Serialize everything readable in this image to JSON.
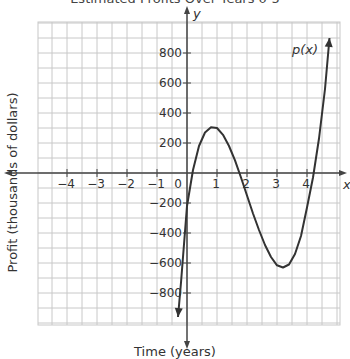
{
  "chart_data": {
    "type": "line",
    "title": "Estimated Profits Over Years 0-5",
    "xlabel": "Time (years)",
    "ylabel": "Profit (thousands of dollars)",
    "x_axis_symbol": "x",
    "y_axis_symbol": "y",
    "series": [
      {
        "name": "p(x)",
        "x": [
          -0.3,
          -0.2,
          0,
          0.2,
          0.4,
          0.6,
          0.8,
          1.0,
          1.2,
          1.4,
          1.6,
          1.8,
          2.0,
          2.2,
          2.4,
          2.6,
          2.8,
          3.0,
          3.2,
          3.4,
          3.6,
          3.8,
          4.0,
          4.2,
          4.4,
          4.6,
          4.75
        ],
        "values": [
          -960,
          -730,
          -220,
          20,
          180,
          270,
          305,
          300,
          255,
          180,
          85,
          -30,
          -150,
          -270,
          -380,
          -480,
          -560,
          -615,
          -630,
          -610,
          -540,
          -420,
          -230,
          -30,
          230,
          560,
          900
        ]
      }
    ],
    "xlim": [
      -5,
      5
    ],
    "ylim": [
      -1000,
      1000
    ],
    "x_ticks": [
      -4,
      -3,
      -2,
      -1,
      0,
      1,
      2,
      3,
      4
    ],
    "x_tick_labels": [
      "−4",
      "−3",
      "−2",
      "−1",
      "0",
      "1",
      "2",
      "3",
      "4"
    ],
    "y_ticks": [
      800,
      600,
      400,
      200,
      -200,
      -400,
      -600,
      -800
    ],
    "y_tick_labels": [
      "800",
      "600",
      "400",
      "200",
      "−200",
      "−400",
      "−600",
      "−800"
    ],
    "grid": true,
    "grid_step_x": 0.5,
    "grid_step_y": 100,
    "annotations": [
      {
        "text": "p(x)",
        "x": 4.4,
        "y": 820
      }
    ],
    "colors": {
      "curve": "#333333",
      "grid": "#c8c8c8",
      "axis": "#444444"
    }
  }
}
